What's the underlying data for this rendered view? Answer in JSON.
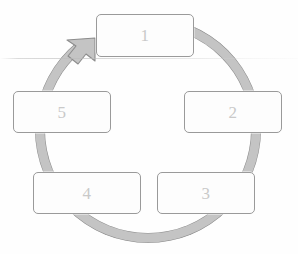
{
  "diagram": {
    "type": "cycle-diagram",
    "title": "",
    "direction": "clockwise",
    "background_color": "#fefefe",
    "ring": {
      "name": "cycle-arrow-ring",
      "fill_color": "#c4c4c4",
      "stroke_color": "#8c8c8c",
      "center_x": 148,
      "center_y": 130,
      "outer_radius": 113,
      "band_width": 10,
      "arrowhead_position": "upper-left",
      "arrowhead_points_to": "1"
    },
    "nodes": [
      {
        "id": "node-1",
        "label": "1",
        "position": "top"
      },
      {
        "id": "node-2",
        "label": "2",
        "position": "right"
      },
      {
        "id": "node-3",
        "label": "3",
        "position": "bottom-right"
      },
      {
        "id": "node-4",
        "label": "4",
        "position": "bottom-left"
      },
      {
        "id": "node-5",
        "label": "5",
        "position": "left"
      }
    ],
    "node_style": {
      "fill_color": "#fdfdfd",
      "border_color": "#9a9a9a",
      "label_color": "#c9c9c9"
    },
    "artifacts": {
      "scan_line_label": "",
      "scan_line_y": 58
    }
  }
}
